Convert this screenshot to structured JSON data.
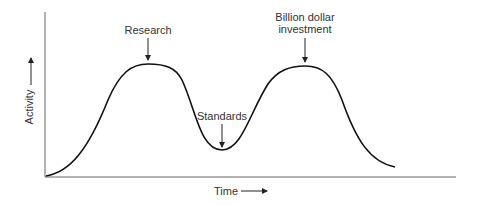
{
  "diagram": {
    "type": "line",
    "title": "",
    "axes": {
      "x_label": "Time",
      "y_label": "Activity",
      "x_arrow": "arrow-right",
      "y_arrow": "arrow-up"
    },
    "annotations": [
      {
        "id": "research",
        "lines": [
          "Research"
        ],
        "points_to": "first peak"
      },
      {
        "id": "standards",
        "lines": [
          "Standards"
        ],
        "points_to": "trough"
      },
      {
        "id": "investment",
        "lines": [
          "Billion dollar",
          "investment"
        ],
        "points_to": "second peak"
      }
    ],
    "curve_description": "Apocalypse of the two elephants: activity rises to a research peak, dips to a trough where standards are set, then rises again to a billion-dollar investment peak before declining.",
    "colors": {
      "line": "#111111",
      "axis": "#555555",
      "text": "#333333",
      "background": "#ffffff"
    }
  }
}
